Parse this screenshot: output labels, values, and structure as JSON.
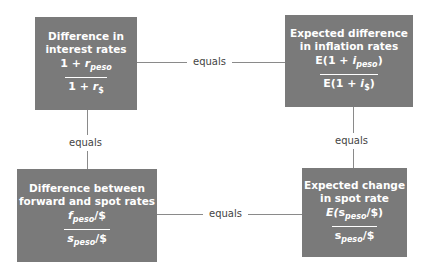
{
  "boxes": {
    "interest": {
      "title_line1": "Difference in",
      "title_line2": "interest rates",
      "numerator": {
        "prefix": "1 + ",
        "var": "r",
        "sub": "peso",
        "suffix": ""
      },
      "denominator": {
        "prefix": "1 + ",
        "var": "r",
        "sub": "$",
        "suffix": ""
      }
    },
    "inflation": {
      "title_line1": "Expected difference",
      "title_line2": "in inflation rates",
      "numerator": {
        "prefix": "E(1 + ",
        "var": "i",
        "sub": "peso",
        "suffix": ")"
      },
      "denominator": {
        "prefix": "E(1 + ",
        "var": "i",
        "sub": "$",
        "suffix": ")"
      }
    },
    "forward": {
      "title_line1": "Difference between",
      "title_line2": "forward and spot rates",
      "numerator": {
        "prefix": "",
        "var": "f",
        "sub": "peso",
        "suffix": "/$"
      },
      "denominator": {
        "prefix": "",
        "var": "s",
        "sub": "peso",
        "suffix": "/$"
      }
    },
    "spot": {
      "title_line1": "Expected change",
      "title_line2": "in spot rate",
      "numerator": {
        "prefix": "E(",
        "var": "s",
        "sub": "peso",
        "suffix": "/$)"
      },
      "denominator": {
        "prefix": "",
        "var": "s",
        "sub": "peso",
        "suffix": "/$"
      }
    }
  },
  "connectors": {
    "top": "equals",
    "bottom": "equals",
    "left": "equals",
    "right": "equals"
  },
  "colors": {
    "box_fill": "#7a7a7a",
    "box_text": "#ffffff",
    "line": "#8a8a8a",
    "label_text": "#444444"
  }
}
